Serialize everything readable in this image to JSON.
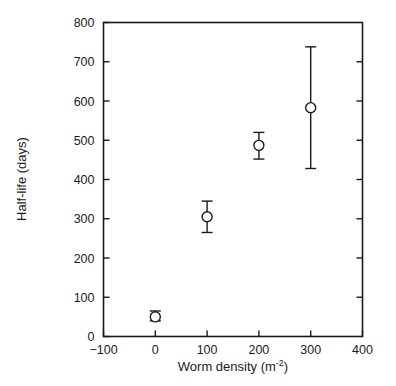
{
  "chart_data": {
    "type": "scatter",
    "title": "",
    "subtitle": "",
    "xlabel": "Worm density (m⁻²)",
    "xlabel_base": "Worm density (m",
    "xlabel_sup": "-2",
    "xlabel_tail": ")",
    "ylabel": "Half-life (days)",
    "xlim": [
      -100,
      400
    ],
    "ylim": [
      0,
      800
    ],
    "xticks": [
      -100,
      0,
      100,
      200,
      300,
      400
    ],
    "xtick_labels": [
      "−100",
      "0",
      "100",
      "200",
      "300",
      "400"
    ],
    "yticks": [
      0,
      100,
      200,
      300,
      400,
      500,
      600,
      700,
      800
    ],
    "ytick_labels": [
      "0",
      "100",
      "200",
      "300",
      "400",
      "500",
      "600",
      "700",
      "800"
    ],
    "grid": false,
    "legend": null,
    "marker_style": "open-circle",
    "error_bars": "symmetric-vertical-with-caps",
    "x": [
      0,
      100,
      200,
      300
    ],
    "y": [
      50,
      305,
      487,
      583
    ],
    "yerr_low": [
      40,
      265,
      452,
      428
    ],
    "yerr_high": [
      65,
      345,
      520,
      738
    ],
    "points": [
      {
        "x": 0,
        "y": 50,
        "low": 40,
        "high": 65
      },
      {
        "x": 100,
        "y": 305,
        "low": 265,
        "high": 345
      },
      {
        "x": 200,
        "y": 487,
        "low": 452,
        "high": 520
      },
      {
        "x": 300,
        "y": 583,
        "low": 428,
        "high": 738
      }
    ],
    "colors": {
      "axis": "#1a1a1a",
      "marker_edge": "#1a1a1a",
      "marker_fill": "#ffffff",
      "error_bar": "#1a1a1a",
      "background": "#ffffff"
    }
  }
}
